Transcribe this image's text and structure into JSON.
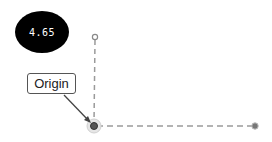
{
  "badge": {
    "value": "4.65",
    "bg_color": "#000000",
    "text_color": "#ffffff"
  },
  "annotation": {
    "label": "Origin"
  },
  "axes": {
    "origin": {
      "x": 94,
      "y": 126
    },
    "y_axis_end": {
      "x": 95,
      "y": 37
    },
    "x_axis_end": {
      "x": 255,
      "y": 126
    },
    "line_color": "#9a9a9a",
    "handle_color": "#777777"
  }
}
